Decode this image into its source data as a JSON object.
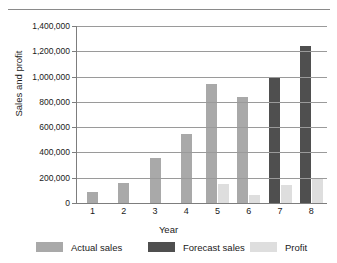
{
  "chart_data": {
    "type": "bar",
    "title": "",
    "xlabel": "Year",
    "ylabel": "Sales and profit",
    "categories": [
      "1",
      "2",
      "3",
      "4",
      "5",
      "6",
      "7",
      "8"
    ],
    "ylim": [
      0,
      1400000
    ],
    "ytick_labels": [
      "0",
      "200,000",
      "400,000",
      "600,000",
      "800,000",
      "1,000,000",
      "1,200,000",
      "1,400,000"
    ],
    "ytick_values": [
      0,
      200000,
      400000,
      600000,
      800000,
      1000000,
      1200000,
      1400000
    ],
    "grid": "horizontal",
    "legend_position": "bottom",
    "series": [
      {
        "name": "Actual sales",
        "color": "#a9a9a9",
        "values": [
          85000,
          160000,
          360000,
          545000,
          940000,
          840000,
          null,
          null
        ]
      },
      {
        "name": "Forecast sales",
        "color": "#4f4f4f",
        "values": [
          null,
          null,
          null,
          null,
          null,
          null,
          985000,
          1245000
        ]
      },
      {
        "name": "Profit",
        "color": "#dedede",
        "values": [
          null,
          null,
          null,
          null,
          150000,
          65000,
          140000,
          195000
        ]
      }
    ]
  },
  "legend": {
    "items": [
      {
        "label": "Actual sales",
        "color": "#a9a9a9"
      },
      {
        "label": "Forecast sales",
        "color": "#4f4f4f"
      },
      {
        "label": "Profit",
        "color": "#dedede"
      }
    ]
  },
  "axes": {
    "x_title": "Year",
    "y_title": "Sales and profit"
  }
}
